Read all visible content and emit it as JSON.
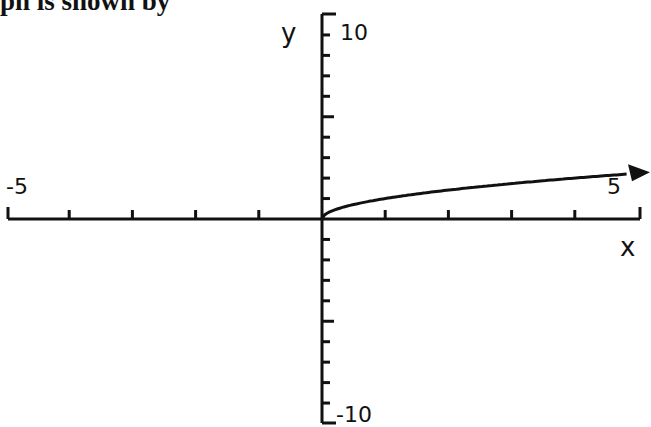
{
  "heading": "ph is shown by",
  "chart_data": {
    "type": "line",
    "title": "",
    "xlabel": "x",
    "ylabel": "y",
    "xlim": [
      -5,
      5
    ],
    "ylim": [
      -10,
      10
    ],
    "x_tick_step": 1,
    "y_tick_step": 1,
    "tick_labels": {
      "x_min": "-5",
      "x_max": "5",
      "y_max": "10",
      "y_min": "-10"
    },
    "grid": false,
    "legend": null,
    "series": [
      {
        "name": "y = sqrt(x)",
        "x": [
          0,
          0.25,
          0.5,
          1,
          1.5,
          2,
          2.5,
          3,
          3.5,
          4,
          4.5,
          5
        ],
        "y": [
          0,
          0.5,
          0.71,
          1,
          1.22,
          1.41,
          1.58,
          1.73,
          1.87,
          2,
          2.12,
          2.24
        ],
        "end_arrow": true
      }
    ]
  }
}
